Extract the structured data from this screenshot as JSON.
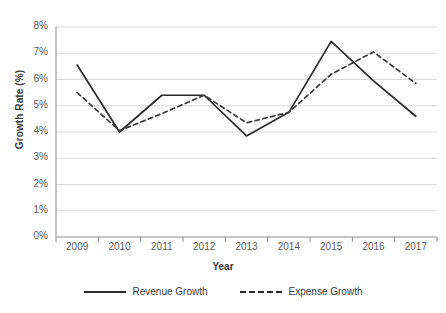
{
  "chart_data": {
    "type": "line",
    "title": "",
    "xlabel": "Year",
    "ylabel": "Growth Rate (%)",
    "categories": [
      "2009",
      "2010",
      "2011",
      "2012",
      "2013",
      "2014",
      "2015",
      "2016",
      "2017"
    ],
    "x": [
      2009,
      2010,
      2011,
      2012,
      2013,
      2014,
      2015,
      2016,
      2017
    ],
    "series": [
      {
        "name": "Revenue Growth",
        "style": "solid",
        "color": "#2b2b2b",
        "values": [
          6.55,
          4.0,
          5.4,
          5.4,
          3.85,
          4.75,
          7.45,
          5.95,
          4.6
        ]
      },
      {
        "name": "Expense Growth",
        "style": "dashed",
        "color": "#3a3a3a",
        "values": [
          5.5,
          4.05,
          4.7,
          5.4,
          4.35,
          4.75,
          6.2,
          7.05,
          5.85
        ]
      }
    ],
    "ylim": [
      0,
      8
    ],
    "ytick_values": [
      0,
      1,
      2,
      3,
      4,
      5,
      6,
      7,
      8
    ],
    "ytick_labels": [
      "0%",
      "1%",
      "2%",
      "3%",
      "4%",
      "5%",
      "6%",
      "7%",
      "8%"
    ],
    "grid": true,
    "grid_axis": "y",
    "grid_color": "#d9d9d9",
    "legend_position": "bottom",
    "background": "#ffffff",
    "axis_color": "#8c8c8c"
  },
  "legend": {
    "items": [
      {
        "label": "Revenue Growth"
      },
      {
        "label": "Expense Growth"
      }
    ]
  }
}
